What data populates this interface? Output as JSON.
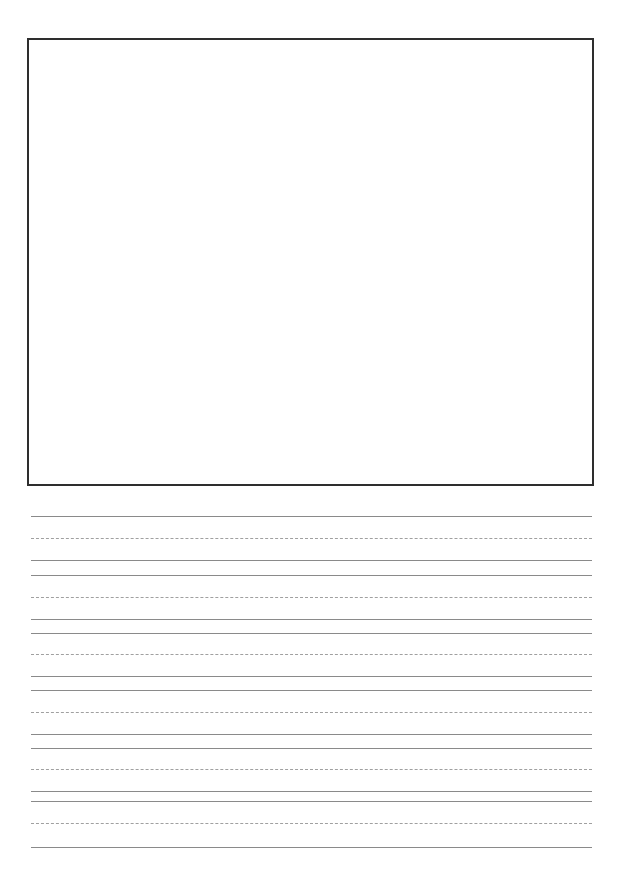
{
  "page": {
    "type": "handwriting-practice-sheet",
    "drawing_box": {
      "border_color": "#2e2e2e"
    },
    "line_groups": [
      {
        "top": 516,
        "mid": 538,
        "base": 560
      },
      {
        "top": 575,
        "mid": 597,
        "base": 619
      },
      {
        "top": 633,
        "mid": 654,
        "base": 676
      },
      {
        "top": 690,
        "mid": 712,
        "base": 734
      },
      {
        "top": 748,
        "mid": 769,
        "base": 791
      },
      {
        "top": 801,
        "mid": 823,
        "base": 847
      }
    ],
    "colors": {
      "solid_line": "#8a8a8a",
      "dashed_line": "#a0a0a0"
    }
  }
}
